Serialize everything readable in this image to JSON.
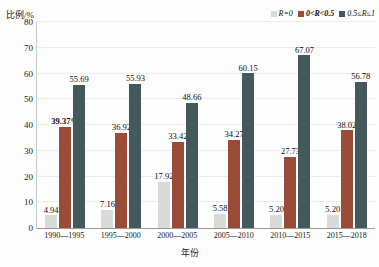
{
  "chart_data": {
    "type": "bar",
    "title": "",
    "xlabel": "年份",
    "ylabel": "比例/%",
    "ylim": [
      0,
      80
    ],
    "ytick_values": [
      80,
      70,
      60,
      50,
      40,
      30,
      20,
      10,
      0
    ],
    "grid": true,
    "legend_position": "top-right",
    "categories": [
      "1990—1995",
      "1995—2000",
      "2000—2005",
      "2005—2010",
      "2010—2015",
      "2015—2018"
    ],
    "series": [
      {
        "name": "R=0",
        "color": "#d8dbd8",
        "values": [
          4.94,
          7.16,
          17.92,
          5.58,
          5.2,
          5.2
        ],
        "labels": [
          "4.94",
          "7.16",
          "17.92",
          "5.58",
          "5.20",
          "5.20"
        ]
      },
      {
        "name": "0<R<0.5",
        "color": "#9a4c39",
        "values": [
          39.37,
          36.92,
          33.42,
          34.27,
          27.73,
          38.02
        ],
        "labels": [
          "39.37%",
          "36.92",
          "33.42",
          "34.27",
          "27.73",
          "38.02"
        ],
        "bold_labels": [
          true,
          false,
          false,
          false,
          false,
          false
        ]
      },
      {
        "name": "0.5≤R≤1",
        "color": "#44595c",
        "values": [
          55.69,
          55.93,
          48.66,
          60.15,
          67.07,
          56.78
        ],
        "labels": [
          "55.69",
          "55.93",
          "48.66",
          "60.15",
          "67.07",
          "56.78"
        ]
      }
    ]
  },
  "legend": {
    "items": [
      {
        "label": "R=0",
        "color": "#d8dbd8",
        "bold": false
      },
      {
        "label": "0<R<0.5",
        "color": "#9a4c39",
        "bold": true
      },
      {
        "label": "0.5≤R≤1",
        "color": "#44595c",
        "bold": false
      }
    ]
  },
  "axes": {
    "y_title": "比例/%",
    "x_title": "年份"
  }
}
